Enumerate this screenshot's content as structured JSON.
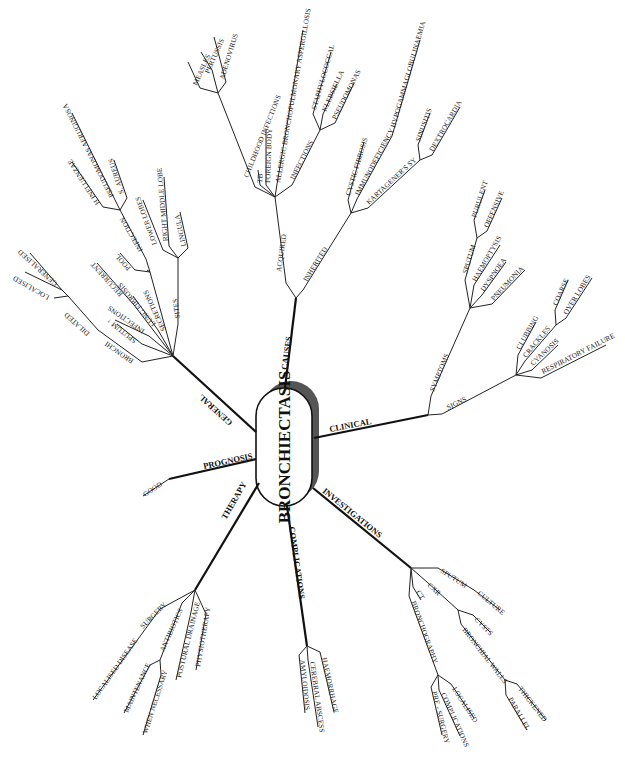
{
  "center": {
    "label": "BRONCHIECTASIS"
  },
  "branches": {
    "causes": {
      "label": "CAUSES",
      "acquired": {
        "label": "ACQUIRED",
        "childhood_infections": {
          "label": "CHILDHOOD INFECTIONS",
          "items": [
            "MEASLES",
            "PERTUSSIS",
            "ADENOVIRUS"
          ]
        },
        "tb": "TB",
        "foreign_body": "FOREIGN BODY",
        "abpa": "ALLERGIC BRONCHOPULMONARY ASPERGILLOSIS",
        "infections": {
          "label": "INFECTIONS",
          "items": [
            "STAPHYLOCOCCAL",
            "KLEBSIELLA",
            "PSEUDOMONAS"
          ]
        }
      },
      "inherited": {
        "label": "INHERITED",
        "cystic_fibrosis": "CYSTIC FIBROSIS",
        "immunodeficiency": {
          "label": "IMMUNODEFICIENCY",
          "items": [
            "HYPOGAMMAGLOBULINAEMIA"
          ]
        },
        "kartageners": {
          "label": "KARTAGENER'S SY",
          "items": [
            "SINUSITIS",
            "DEXTROCARDIA"
          ]
        }
      }
    },
    "clinical": {
      "label": "CLINICAL",
      "symptoms": {
        "label": "SYMPTOMS",
        "sputum": {
          "label": "SPUTUM",
          "items": [
            "PURULENT",
            "OFFENSIVE"
          ]
        },
        "items": [
          "HAEMOPTYSIS",
          "DYSPNOEA",
          "PNEUMONIA"
        ]
      },
      "signs": {
        "label": "SIGNS",
        "clubbing": "CLUBBING",
        "crackles": {
          "label": "CRACKLES",
          "items": [
            "COARSE",
            "OVER LOBES"
          ]
        },
        "cyanosis": "CYANOSIS",
        "respiratory_failure": "RESPIRATORY FAILURE"
      }
    },
    "investigations": {
      "label": "INVESTIGATIONS",
      "sputum": {
        "label": "SPUTUM",
        "items": [
          "CULTURE"
        ]
      },
      "cxr": {
        "label": "CXR",
        "cysts": "CYSTS",
        "bronchial_walls": {
          "label": "BRONCHIAL WALLS",
          "items": [
            "THICKENED",
            "PARALLEL"
          ]
        }
      },
      "ct": "CT",
      "bronchography": {
        "label": "BRONCHOGRAPHY",
        "items": [
          "LOCALISED",
          "COMPLICATIONS",
          "PRE - SURGERY"
        ]
      }
    },
    "complications": {
      "label": "COMPLICATIONS",
      "items": [
        "AMYLOIDOSIS",
        "CEREBRAL ABSCESS",
        "HAEMORRHAGE"
      ]
    },
    "therapy": {
      "label": "THERAPY",
      "surgery": {
        "label": "SURGERY",
        "items": [
          "LOCALISED DISEASE"
        ]
      },
      "antibiotics": {
        "label": "ANTIBIOTICS",
        "items": [
          "MAINTENANCE",
          "WHEN NECESSARY"
        ]
      },
      "postural_drainage": "POSTURAL DRAINAGE",
      "physiotherapy": "PHYSIOTHERAPY"
    },
    "prognosis": {
      "label": "PROGNOSIS",
      "items": [
        "GOOD"
      ]
    },
    "general": {
      "label": "GENERAL",
      "bronchi": "BRONCHI",
      "dilated": {
        "label": "DILATED",
        "items": [
          "LOCALISED",
          "GENERALISED"
        ]
      },
      "sputum_up": "SPUTUM ↑",
      "infections": "INFECTIONS",
      "lung_fibrosis": "LUNG FIBROSIS",
      "recurrent": "RECURRENT",
      "secretions": {
        "label": "SECRETIONS",
        "pool": "POOL",
        "infection": {
          "label": "INFECTION",
          "items": [
            "H INFLUENZAE",
            "PSEUDOMONAS AERUGINOSA",
            "S. AUREUS"
          ]
        }
      },
      "sites": {
        "label": "SITES",
        "items": [
          "LOWER LOBES",
          "RIGHT MIDDLE LOBE",
          "LINGULA"
        ]
      }
    }
  }
}
